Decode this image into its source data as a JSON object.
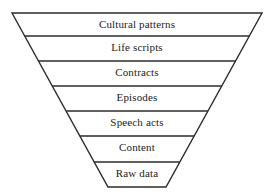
{
  "diagram": {
    "type": "funnel",
    "orientation": "inverted-trapezoid",
    "title": "",
    "stroke_color": "#2b2b2b",
    "fill_color": "#ffffff",
    "text_color": "#232323",
    "geometry": {
      "top_left_x": 12,
      "top_right_x": 262,
      "top_y": 13,
      "bottom_left_x": 108,
      "bottom_right_x": 166,
      "bottom_y": 187
    },
    "bands": [
      {
        "label": "Cultural patterns",
        "level": 1,
        "divider_y": 36,
        "text_y": 25
      },
      {
        "label": "Life scripts",
        "level": 2,
        "divider_y": 61,
        "text_y": 48
      },
      {
        "label": "Contracts",
        "level": 3,
        "divider_y": 86,
        "text_y": 73
      },
      {
        "label": "Episodes",
        "level": 4,
        "divider_y": 111,
        "text_y": 98
      },
      {
        "label": "Speech acts",
        "level": 5,
        "divider_y": 136,
        "text_y": 123
      },
      {
        "label": "Content",
        "level": 6,
        "divider_y": 162,
        "text_y": 148
      },
      {
        "label": "Raw data",
        "level": 7,
        "divider_y": null,
        "text_y": 174
      }
    ]
  }
}
